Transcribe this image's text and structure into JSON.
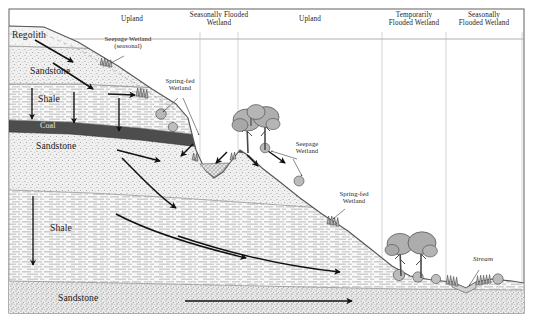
{
  "figure": {
    "frame_color": "#6e6e6e",
    "background": "#ffffff"
  },
  "zone_header": {
    "divider_color": "#b9b9b9",
    "baseline_color": "#9a9a9a",
    "zones": [
      {
        "id": "upland-1",
        "label": "Upland",
        "x_center": 132,
        "x_start": 10,
        "x_end": 200
      },
      {
        "id": "seasonally-flooded-1",
        "label": "Seasonally Flooded\nWetland",
        "x_center": 219,
        "x_start": 200,
        "x_end": 238
      },
      {
        "id": "upland-2",
        "label": "Upland",
        "x_center": 310,
        "x_start": 238,
        "x_end": 382
      },
      {
        "id": "temporarily-flooded",
        "label": "Temporarily\nFlooded Wetland",
        "x_center": 414,
        "x_start": 382,
        "x_end": 446
      },
      {
        "id": "seasonally-flooded-2",
        "label": "Seasonally\nFlooded Wetland",
        "x_center": 484,
        "x_start": 446,
        "x_end": 522
      }
    ]
  },
  "strata": [
    {
      "id": "regolith",
      "label": "Regolith",
      "x": 12,
      "y": 30,
      "color": "#f2f2f2"
    },
    {
      "id": "sandstone-top",
      "label": "Sandstone",
      "x": 30,
      "y": 66,
      "color": "#ececec"
    },
    {
      "id": "shale-upper",
      "label": "Shale",
      "x": 38,
      "y": 94,
      "color": "#f7f7f7"
    },
    {
      "id": "coal",
      "label": "Coal",
      "x": 40,
      "y": 122,
      "color": "#4d4d4d"
    },
    {
      "id": "sandstone-mid",
      "label": "Sandstone",
      "x": 36,
      "y": 141,
      "color": "#ececec"
    },
    {
      "id": "shale-lower",
      "label": "Shale",
      "x": 50,
      "y": 223,
      "color": "#f7f7f7"
    },
    {
      "id": "sandstone-bot",
      "label": "Sandstone",
      "x": 58,
      "y": 293,
      "color": "#e6e6e6"
    }
  ],
  "callouts": [
    {
      "id": "seepage-wetland-seasonal",
      "label": "Seepage Wetland\n(seasonal)",
      "x": 90,
      "y": 35,
      "w": 76
    },
    {
      "id": "spring-fed-wetland-left",
      "label": "Spring-fed\nWetland",
      "x": 156,
      "y": 77,
      "w": 48
    },
    {
      "id": "seepage-wetland-right",
      "label": "Seepage\nWetland",
      "x": 287,
      "y": 140,
      "w": 40
    },
    {
      "id": "spring-fed-wetland-right",
      "label": "Spring-fed\nWetland",
      "x": 330,
      "y": 190,
      "w": 48
    },
    {
      "id": "stream",
      "label": "Stream",
      "x": 466,
      "y": 256,
      "w": 34
    }
  ],
  "flow_arrows": {
    "color": "#111111",
    "description": "Groundwater flow direction arrows through regolith, sandstone, shale and coal units"
  },
  "vegetation": {
    "tree_fill": "#b2b2b2",
    "tree_outline": "#4a4a4a",
    "shrub_fill": "#c8c8c8",
    "count_trees": 5,
    "count_shrubs": 11
  },
  "water": {
    "pond_fill": "#d8d8d8",
    "stream_fill": "#d0d0d0"
  }
}
